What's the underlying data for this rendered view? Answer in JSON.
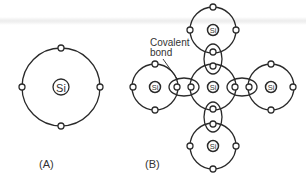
{
  "figure": {
    "panel_a": {
      "label": "(A)",
      "atom": {
        "symbol": "Si",
        "valence_electrons": 4
      }
    },
    "panel_b": {
      "label": "(B)",
      "annotation": {
        "line1": "Covalent",
        "line2": "bond"
      },
      "atoms": [
        {
          "position": "center",
          "symbol": "Si"
        },
        {
          "position": "top",
          "symbol": "Si"
        },
        {
          "position": "left",
          "symbol": "Si"
        },
        {
          "position": "right",
          "symbol": "Si"
        },
        {
          "position": "bottom",
          "symbol": "Si"
        }
      ],
      "bonds": [
        "top",
        "left",
        "right",
        "bottom"
      ]
    },
    "colors": {
      "stroke": "#2a2a2a",
      "text": "#333333",
      "background": "#ffffff"
    }
  }
}
